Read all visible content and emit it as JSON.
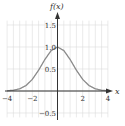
{
  "chart_data": {
    "type": "line",
    "title": "",
    "xlabel": "x",
    "ylabel": "f(x)",
    "xlim": [
      -4,
      4
    ],
    "ylim": [
      -0.5,
      1.6
    ],
    "grid": true,
    "grid_step": 0.5,
    "x_ticks": [
      -4,
      -2,
      2,
      4
    ],
    "x_tick_labels": [
      "−4",
      "−2",
      "2",
      "4"
    ],
    "y_ticks": [
      1.5,
      1.0,
      0.5,
      -0.5
    ],
    "y_tick_labels": [
      "1.5",
      "1.0",
      "0.5",
      "−0.5"
    ],
    "series": [
      {
        "name": "f(x)",
        "x": [
          -4,
          -3.5,
          -3,
          -2.5,
          -2,
          -1.5,
          -1,
          -0.5,
          0,
          0.5,
          1,
          1.5,
          2,
          2.5,
          3,
          3.5,
          4
        ],
        "values": [
          0.005,
          0.017,
          0.05,
          0.124,
          0.264,
          0.472,
          0.717,
          0.92,
          1.0,
          0.92,
          0.717,
          0.472,
          0.264,
          0.124,
          0.05,
          0.017,
          0.005
        ]
      }
    ],
    "legend": null
  },
  "labels": {
    "y_axis": "f(x)",
    "x_axis": "x"
  },
  "colors": {
    "curve": "#8a8a8a",
    "axis": "#333333",
    "grid": "#dcdcdc"
  }
}
